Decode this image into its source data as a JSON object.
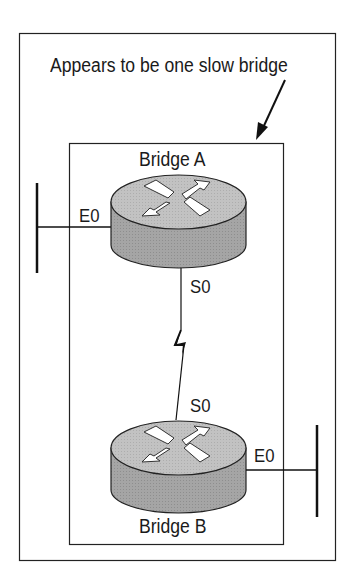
{
  "diagram": {
    "caption": "Appears to be one slow bridge",
    "bridge_a": {
      "name": "Bridge A",
      "ethernet_port": "E0",
      "serial_port": "S0"
    },
    "bridge_b": {
      "name": "Bridge B",
      "ethernet_port": "E0",
      "serial_port": "S0"
    },
    "colors": {
      "router_top": "#bdbdbd",
      "router_side": "#9a9a9a",
      "line": "#1a1a1a"
    }
  }
}
